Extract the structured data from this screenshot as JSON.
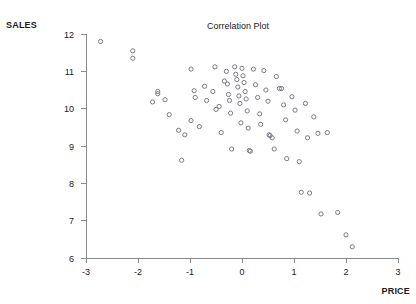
{
  "chart_data": {
    "type": "scatter",
    "title": "Correlation Plot",
    "xlabel": "PRICE",
    "ylabel": "SALES",
    "xlim": [
      -3,
      3
    ],
    "ylim": [
      6,
      12
    ],
    "xticks": [
      -3,
      -2,
      -1,
      0,
      1,
      2,
      3
    ],
    "xtick_labels": [
      "-3",
      "-2",
      "-1",
      "0",
      "1",
      "2",
      "3"
    ],
    "yticks": [
      6,
      7,
      8,
      9,
      10,
      11,
      12
    ],
    "ytick_labels": [
      "6",
      "7",
      "8",
      "9",
      "10",
      "11",
      "12"
    ],
    "grid": false,
    "legend": null,
    "marker": "open-circle",
    "marker_color": "#7a7a86",
    "axis_color": "#8a8a8a",
    "background": "#ffffff",
    "series": [
      {
        "name": "observations",
        "points": [
          [
            -2.72,
            11.8
          ],
          [
            -2.1,
            11.55
          ],
          [
            -2.1,
            11.35
          ],
          [
            -1.62,
            10.46
          ],
          [
            -1.62,
            10.4
          ],
          [
            -1.72,
            10.18
          ],
          [
            -1.48,
            10.24
          ],
          [
            -1.4,
            9.84
          ],
          [
            -1.22,
            9.42
          ],
          [
            -1.1,
            9.3
          ],
          [
            -1.16,
            8.62
          ],
          [
            -0.98,
            11.06
          ],
          [
            -0.92,
            10.48
          ],
          [
            -0.9,
            10.3
          ],
          [
            -0.98,
            9.68
          ],
          [
            -0.82,
            9.52
          ],
          [
            -0.72,
            10.6
          ],
          [
            -0.68,
            10.22
          ],
          [
            -0.56,
            10.46
          ],
          [
            -0.52,
            11.12
          ],
          [
            -0.5,
            9.98
          ],
          [
            -0.44,
            10.06
          ],
          [
            -0.4,
            9.36
          ],
          [
            -0.34,
            10.74
          ],
          [
            -0.3,
            11.0
          ],
          [
            -0.28,
            10.66
          ],
          [
            -0.26,
            10.38
          ],
          [
            -0.24,
            10.22
          ],
          [
            -0.22,
            9.88
          ],
          [
            -0.2,
            8.92
          ],
          [
            -0.14,
            11.12
          ],
          [
            -0.12,
            10.92
          ],
          [
            -0.1,
            10.78
          ],
          [
            -0.08,
            10.58
          ],
          [
            -0.06,
            10.34
          ],
          [
            -0.04,
            10.14
          ],
          [
            -0.02,
            9.62
          ],
          [
            0.0,
            11.08
          ],
          [
            0.02,
            10.88
          ],
          [
            0.04,
            10.7
          ],
          [
            0.06,
            10.46
          ],
          [
            0.08,
            10.26
          ],
          [
            0.1,
            9.94
          ],
          [
            0.12,
            9.48
          ],
          [
            0.14,
            8.88
          ],
          [
            0.16,
            8.86
          ],
          [
            0.22,
            11.06
          ],
          [
            0.26,
            10.64
          ],
          [
            0.3,
            10.3
          ],
          [
            0.34,
            9.86
          ],
          [
            0.36,
            9.58
          ],
          [
            0.42,
            11.02
          ],
          [
            0.46,
            10.5
          ],
          [
            0.5,
            10.2
          ],
          [
            0.52,
            9.3
          ],
          [
            0.54,
            9.28
          ],
          [
            0.58,
            9.22
          ],
          [
            0.62,
            8.92
          ],
          [
            0.66,
            10.86
          ],
          [
            0.72,
            10.54
          ],
          [
            0.76,
            10.54
          ],
          [
            0.8,
            10.1
          ],
          [
            0.84,
            9.7
          ],
          [
            0.86,
            8.66
          ],
          [
            0.96,
            10.32
          ],
          [
            1.02,
            9.96
          ],
          [
            1.06,
            9.4
          ],
          [
            1.1,
            8.58
          ],
          [
            1.14,
            7.76
          ],
          [
            1.22,
            10.14
          ],
          [
            1.26,
            9.22
          ],
          [
            1.3,
            7.74
          ],
          [
            1.38,
            9.78
          ],
          [
            1.46,
            9.34
          ],
          [
            1.52,
            7.18
          ],
          [
            1.64,
            9.36
          ],
          [
            1.84,
            7.22
          ],
          [
            2.0,
            6.62
          ],
          [
            2.12,
            6.3
          ]
        ]
      }
    ]
  },
  "axis_labels": {
    "y_name": "SALES",
    "x_name": "PRICE"
  }
}
